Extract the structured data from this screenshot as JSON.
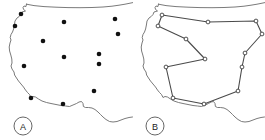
{
  "figure": {
    "width": 265,
    "height": 140,
    "background_color": "#ffffff",
    "outline_color": "#6b6b6b",
    "dot_color": "#111111",
    "edge_color": "#4a4a4a",
    "node_fill_color": "#ffffff",
    "node_stroke_color": "#333333"
  },
  "panels": [
    {
      "id": "panel-a",
      "badge_label": "A",
      "badge_x": 23,
      "badge_y": 126,
      "badge_r": 9,
      "map_outline": "M 26.5 4 L 26.0 6.5 L 24.0 6.0 L 23.0 7.5 L 23.6 9.5 L 25.5 11.0 L 22.0 12.0 L 21.0 14.5 L 19.2 16.5 L 17.0 18.0 L 15.0 21.0 L 14.4 25.0 L 13.6 29.0 L 12.5 32.0 L 11.0 34.5 L 10.2 37.5 L 11.0 40.0 L 10.0 43.0 L 9.2 47.0 L 9.6 51.0 L 10.8 55.0 L 11.8 59.0 L 12.0 63.0 L 11.0 66.0 L 12.0 69.0 L 14.0 72.0 L 14.6 75.0 L 16.5 78.0 L 18.5 81.0 L 21.0 84.0 L 23.5 87.0 L 25.5 90.0 L 27.5 92.5 L 29.5 94.5 L 31.0 97.5 L 33.0 96.5 L 35.5 97.0 L 38.5 99.0 L 42.0 101.0 L 46.5 102.5 L 51.0 103.5 L 56.0 104.5 L 61.0 105.5 L 65.5 106.0 L 69.5 106.5 L 73.0 105.0 L 76.5 103.5 L 79.0 102.0 L 81.5 101.5 L 83.0 103.5 L 83.4 106.5 L 85.5 107.5 L 88.5 107.5 L 92.0 108.0 L 95.0 109.5 L 98.0 112.0 L 100.5 114.5 L 103.0 117.0 L 106.0 119.5 L 109.5 121.5 L 113.0 122.0 L 117.0 121.5 L 121.0 120.0 L 125.0 118.5 L 129.0 117.5 L 132.5 117.0",
      "top_border": "M 26.5 4.2 L 34 5.6 L 44 6.6 L 56 7.2 L 68 7.6 L 80 7.7 L 92 7.5 L 103 7.0 L 112 6.2 L 119 5.2 L 125 4.2 L 130 3.2 L 132.8 2.6",
      "cities": [
        {
          "id": "c1",
          "x": 21,
          "y": 14,
          "label": "Seattle"
        },
        {
          "id": "c2",
          "x": 15,
          "y": 26,
          "label": "Portland"
        },
        {
          "id": "c3",
          "x": 64,
          "y": 22,
          "label": "Billings"
        },
        {
          "id": "c4",
          "x": 115,
          "y": 19,
          "label": "Bismarck"
        },
        {
          "id": "c5",
          "x": 43,
          "y": 41,
          "label": "Boise"
        },
        {
          "id": "c6",
          "x": 118,
          "y": 34,
          "label": "Omaha"
        },
        {
          "id": "c7",
          "x": 64,
          "y": 57,
          "label": "Salt Lake City"
        },
        {
          "id": "c8",
          "x": 99,
          "y": 54,
          "label": "Denver"
        },
        {
          "id": "c9",
          "x": 99,
          "y": 64,
          "label": "Colorado Springs"
        },
        {
          "id": "c10",
          "x": 24,
          "y": 66,
          "label": "Sacramento"
        },
        {
          "id": "c11",
          "x": 94,
          "y": 91,
          "label": "Albuquerque"
        },
        {
          "id": "c12",
          "x": 31,
          "y": 98,
          "label": "Los Angeles"
        },
        {
          "id": "c13",
          "x": 63,
          "y": 104,
          "label": "Phoenix"
        }
      ],
      "dot_radius": 2.3
    },
    {
      "id": "panel-b",
      "badge_label": "B",
      "badge_x": 23,
      "badge_y": 126,
      "badge_r": 9,
      "map_outline": "M 26.5 4 L 26.0 6.5 L 24.0 6.0 L 23.0 7.5 L 23.6 9.5 L 25.5 11.0 L 22.0 12.0 L 21.0 14.5 L 19.2 16.5 L 17.0 18.0 L 15.0 21.0 L 14.4 25.0 L 13.6 29.0 L 12.5 32.0 L 11.0 34.5 L 10.2 37.5 L 11.0 40.0 L 10.0 43.0 L 9.2 47.0 L 9.6 51.0 L 10.8 55.0 L 11.8 59.0 L 12.0 63.0 L 11.0 66.0 L 12.0 69.0 L 14.0 72.0 L 14.6 75.0 L 16.5 78.0 L 18.5 81.0 L 21.0 84.0 L 23.5 87.0 L 25.5 90.0 L 27.5 92.5 L 29.5 94.5 L 31.0 97.5 L 33.0 96.5 L 35.5 97.0 L 38.5 99.0 L 42.0 101.0 L 46.5 102.5 L 51.0 103.5 L 56.0 104.5 L 61.0 105.5 L 65.5 106.0 L 69.5 106.5 L 73.0 105.0 L 76.5 103.5 L 79.0 102.0 L 81.5 101.5 L 83.0 103.5 L 83.4 106.5 L 85.5 107.5 L 88.5 107.5 L 92.0 108.0 L 95.0 109.5 L 98.0 112.0 L 100.5 114.5 L 103.0 117.0 L 106.0 119.5 L 109.5 121.5 L 113.0 122.0 L 117.0 121.5 L 121.0 120.0 L 125.0 118.5 L 129.0 117.5 L 132.5 117.0",
      "top_border": "M 26.5 4.2 L 34 5.6 L 44 6.6 L 56 7.2 L 68 7.6 L 80 7.7 L 92 7.5 L 103 7.0 L 112 6.2 L 119 5.2 L 125 4.2 L 130 3.2 L 132.8 2.6",
      "tour_nodes": [
        {
          "id": "n1",
          "x": 30,
          "y": 15,
          "label": "Seattle"
        },
        {
          "id": "n2",
          "x": 26,
          "y": 26,
          "label": "Portland"
        },
        {
          "id": "n3",
          "x": 54,
          "y": 39,
          "label": "Boise"
        },
        {
          "id": "n4",
          "x": 73,
          "y": 59,
          "label": "Salt Lake City"
        },
        {
          "id": "n5",
          "x": 34,
          "y": 67,
          "label": "Sacramento"
        },
        {
          "id": "n6",
          "x": 41,
          "y": 98,
          "label": "Los Angeles"
        },
        {
          "id": "n7",
          "x": 72,
          "y": 104,
          "label": "Phoenix"
        },
        {
          "id": "n8",
          "x": 106,
          "y": 91,
          "label": "Albuquerque"
        },
        {
          "id": "n9",
          "x": 110,
          "y": 67,
          "label": "Colorado Springs"
        },
        {
          "id": "n10",
          "x": 113,
          "y": 53,
          "label": "Denver"
        },
        {
          "id": "n11",
          "x": 130,
          "y": 34,
          "label": "Omaha"
        },
        {
          "id": "n12",
          "x": 124,
          "y": 21,
          "label": "Bismarck"
        },
        {
          "id": "n13",
          "x": 76,
          "y": 22,
          "label": "Billings"
        }
      ],
      "tour_order": [
        "n1",
        "n2",
        "n3",
        "n4",
        "n5",
        "n6",
        "n7",
        "n8",
        "n9",
        "n10",
        "n11",
        "n12",
        "n13",
        "n1"
      ],
      "node_radius": 1.9
    }
  ],
  "chart_data": {
    "type": "scatter",
    "title": "",
    "xlabel": "",
    "ylabel": "",
    "panels": [
      {
        "name": "A",
        "kind": "points",
        "n_points": 13,
        "x": [
          21,
          15,
          64,
          115,
          43,
          118,
          64,
          99,
          99,
          24,
          94,
          31,
          63
        ],
        "y": [
          14,
          26,
          22,
          19,
          41,
          34,
          57,
          54,
          64,
          66,
          91,
          98,
          104
        ]
      },
      {
        "name": "B",
        "kind": "tour",
        "n_points": 13,
        "x": [
          30,
          26,
          54,
          73,
          34,
          41,
          72,
          106,
          110,
          113,
          130,
          124,
          76
        ],
        "y": [
          15,
          26,
          39,
          59,
          67,
          98,
          104,
          91,
          67,
          53,
          34,
          21,
          22
        ],
        "closed": true
      }
    ]
  }
}
